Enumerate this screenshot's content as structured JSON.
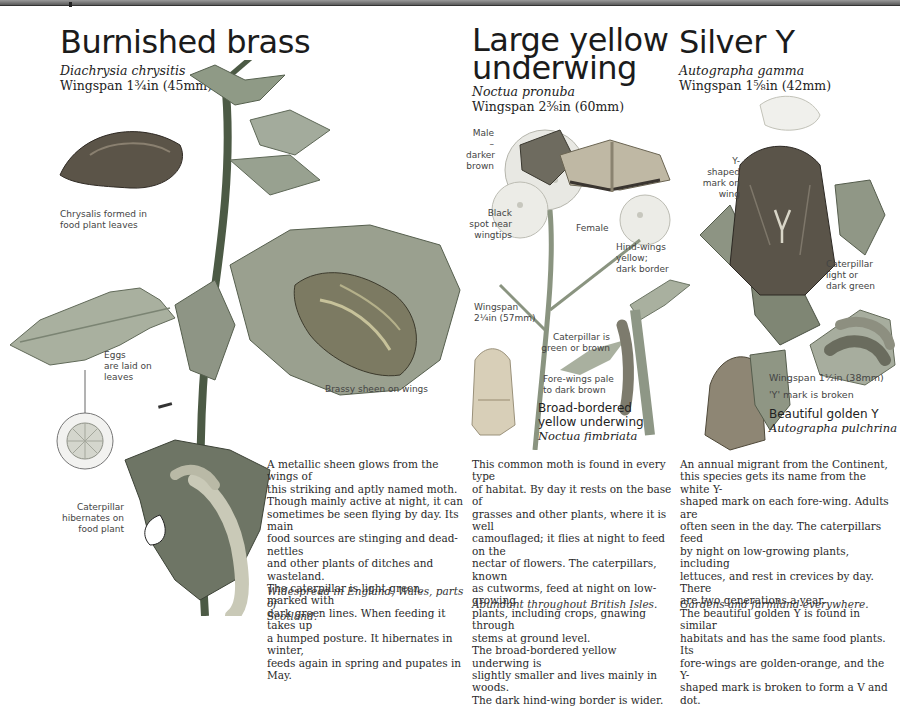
{
  "page": {
    "topbar": {
      "accent": "#6b6b6b"
    }
  },
  "species": [
    {
      "id": "burnished-brass",
      "common_name": "Burnished brass",
      "latin_name": "Diachrysia chrysitis",
      "wingspan": "Wingspan 1¾in (45mm)",
      "labels": {
        "chrysalis": [
          "Chrysalis formed in",
          "food plant leaves"
        ],
        "eggs": [
          "Eggs",
          "are laid on",
          "leaves"
        ],
        "brassy": "Brassy sheen on wings",
        "caterpillar": [
          "Caterpillar",
          "hibernates on",
          "food plant"
        ]
      },
      "description": [
        "A metallic sheen glows from the wings of",
        "this striking and aptly named moth.",
        "Though mainly active at night, it can",
        "sometimes be seen flying by day. Its main",
        "food sources are stinging and dead-nettles",
        "and other plants of ditches and wasteland.",
        "The caterpillar is light green, marked with",
        "dark green lines. When feeding it takes up",
        "a humped posture. It hibernates in winter,",
        "feeds again in spring and pupates in May."
      ],
      "distribution": [
        "Widespread in England, Wales, parts of",
        "Scotland."
      ]
    },
    {
      "id": "large-yellow-underwing",
      "common_name": [
        "Large yellow",
        "underwing"
      ],
      "latin_name": "Noctua pronuba",
      "wingspan": "Wingspan 2⅜in (60mm)",
      "labels": {
        "male": [
          "Male –",
          "darker",
          "brown"
        ],
        "black_spot": [
          "Black",
          "spot near",
          "wingtips"
        ],
        "female": "Female",
        "hindwings": [
          "Hind-wings",
          "yellow;",
          "dark border"
        ],
        "wingspan_small": [
          "Wingspan",
          "2¼in (57mm)"
        ],
        "caterpillar": [
          "Caterpillar is",
          "green or brown"
        ],
        "forewings": [
          "Fore-wings pale",
          "to dark brown"
        ]
      },
      "related": {
        "common_name": [
          "Broad-bordered",
          "yellow underwing"
        ],
        "latin_name": "Noctua fimbriata"
      },
      "description": [
        "This common moth is found in every type",
        "of habitat. By day it rests on the base of",
        "grasses and other plants, where it is well",
        "camouflaged; it flies at night to feed on the",
        "nectar of flowers. The caterpillars, known",
        "as cutworms, feed at night on low-growing",
        "plants, including crops, gnawing through",
        "stems at ground level.",
        "The broad-bordered yellow underwing is",
        "slightly smaller and lives mainly in woods.",
        "The dark hind-wing border is wider."
      ],
      "distribution": [
        "Abundant throughout British Isles."
      ]
    },
    {
      "id": "silver-y",
      "common_name": "Silver Y",
      "latin_name": "Autographa gamma",
      "wingspan": "Wingspan 1⅝in (42mm)",
      "labels": {
        "y_mark": [
          "Y-shaped",
          "mark on",
          "wing"
        ],
        "caterpillar": [
          "Caterpillar",
          "light or",
          "dark green"
        ],
        "wingspan_small": "Wingspan 1½in (38mm)",
        "broken": "'Y' mark is broken"
      },
      "related": {
        "common_name": "Beautiful golden Y",
        "latin_name": "Autographa pulchrina"
      },
      "description": [
        "An annual migrant from the Continent,",
        "this species gets its name from the white Y-",
        "shaped mark on each fore-wing. Adults are",
        "often seen in the day. The caterpillars feed",
        "by night on low-growing plants, including",
        "lettuces, and rest in crevices by day. There",
        "are two generations a year.",
        "The beautiful golden Y is found in similar",
        "habitats and has the same food plants. Its",
        "fore-wings are golden-orange, and the Y-",
        "shaped mark is broken to form a V and dot."
      ],
      "distribution": [
        "Gardens and farmland everywhere."
      ]
    }
  ]
}
